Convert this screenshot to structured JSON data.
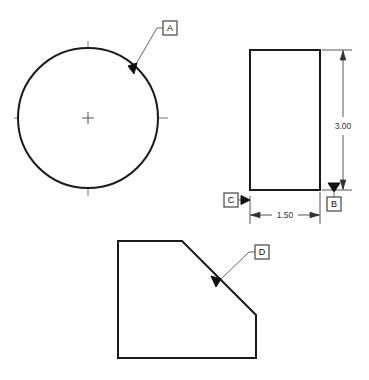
{
  "drawing": {
    "title": "Engineering Drawing - Three Views with Datum Features",
    "background_color": "#ffffff",
    "line_color": "#1a1a1a",
    "centerline_color": "#777777",
    "dimension_color": "#555555",
    "views": {
      "circle_view": {
        "name": "circular-profile-view",
        "center_x": 88,
        "center_y": 118,
        "radius": 70,
        "centerline_h_x1": 14,
        "centerline_h_x2": 168,
        "centerline_v_y1": 41,
        "centerline_v_y2": 196
      },
      "rectangle_view": {
        "name": "rectangular-profile-view",
        "x": 250,
        "y": 50,
        "width": 70,
        "height": 140
      },
      "polygon_view": {
        "name": "chamfered-profile-view",
        "points": "118,241 182,241 256,315 256,358 118,358"
      }
    },
    "datums": [
      {
        "id": "datum-a",
        "label": "A",
        "box_x": 163,
        "box_y": 21,
        "box_w": 14,
        "box_h": 14,
        "stub_x1": 163,
        "stub_x2": 157,
        "leader_from_x": 157,
        "leader_from_y": 28,
        "leader_to_x": 136,
        "leader_to_y": 64,
        "triangle": "136,64 130,67 135,73",
        "target": "circle-edge"
      },
      {
        "id": "datum-b",
        "label": "B",
        "box_x": 327,
        "box_y": 197,
        "box_w": 14,
        "box_h": 14,
        "stub_x": 334,
        "stub_y1": 197,
        "stub_y2": 190,
        "triangle": "328,184 340,184 334,192",
        "target": "rectangle-bottom-extension"
      },
      {
        "id": "datum-c",
        "label": "C",
        "box_x": 224,
        "box_y": 193,
        "box_w": 14,
        "box_h": 14,
        "stub_x1": 238,
        "stub_x2": 244,
        "stub_y": 200,
        "triangle": "250,200 242,196 242,204",
        "target": "rectangle-left-edge"
      },
      {
        "id": "datum-d",
        "label": "D",
        "box_x": 255,
        "box_y": 245,
        "box_w": 14,
        "box_h": 14,
        "stub_x1": 255,
        "stub_x2": 249,
        "leader_from_x": 249,
        "leader_from_y": 252,
        "leader_to_x": 220,
        "leader_to_y": 280,
        "triangle": "220,280 213,277 217,287",
        "target": "chamfer-edge"
      }
    ],
    "dimensions": [
      {
        "id": "dim-height",
        "value": "3.00",
        "orientation": "vertical",
        "line_x": 343,
        "y_top": 50,
        "y_bottom": 190,
        "text_x": 343,
        "text_y": 126,
        "ext_top_y": 50,
        "ext_bottom_y": 190,
        "ext_x1": 322,
        "ext_x2": 352
      },
      {
        "id": "dim-width",
        "value": "1.50",
        "orientation": "horizontal",
        "line_y": 215,
        "x_left": 250,
        "x_right": 320,
        "text_x": 285,
        "text_y": 215,
        "ext_left_x": 250,
        "ext_right_x": 320,
        "ext_y1": 192,
        "ext_y2": 224
      }
    ]
  }
}
